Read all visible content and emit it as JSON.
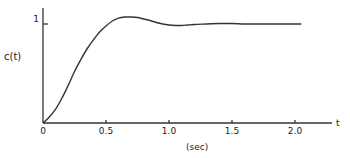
{
  "chart_data": {
    "type": "line",
    "title": "",
    "xlabel": "(sec)",
    "ylabel": "c(t)",
    "x_axis_end_label": "t",
    "xlim": [
      0,
      2.25
    ],
    "ylim": [
      0,
      1.15
    ],
    "x_ticks": [
      0,
      0.5,
      1.0,
      1.5,
      2.0
    ],
    "x_tick_labels": [
      "0",
      "0.5",
      "1.0",
      "1.5",
      "2.0"
    ],
    "y_ticks": [
      1
    ],
    "y_tick_labels": [
      "1"
    ],
    "grid": false,
    "legend": null,
    "series": [
      {
        "name": "c(t)",
        "x": [
          0,
          0.05,
          0.1,
          0.15,
          0.2,
          0.25,
          0.3,
          0.35,
          0.4,
          0.45,
          0.5,
          0.55,
          0.6,
          0.65,
          0.7,
          0.75,
          0.8,
          0.85,
          0.9,
          0.95,
          1.0,
          1.05,
          1.1,
          1.15,
          1.2,
          1.3,
          1.4,
          1.5,
          1.6,
          1.7,
          1.8,
          1.9,
          2.0,
          2.05
        ],
        "values": [
          0,
          0.06,
          0.14,
          0.25,
          0.38,
          0.52,
          0.64,
          0.75,
          0.84,
          0.92,
          0.98,
          1.03,
          1.06,
          1.07,
          1.07,
          1.065,
          1.05,
          1.035,
          1.015,
          1.0,
          0.99,
          0.985,
          0.985,
          0.99,
          0.995,
          1.0,
          1.005,
          1.005,
          1.0,
          1.0,
          1.0,
          1.0,
          1.0,
          1.0
        ]
      }
    ]
  }
}
